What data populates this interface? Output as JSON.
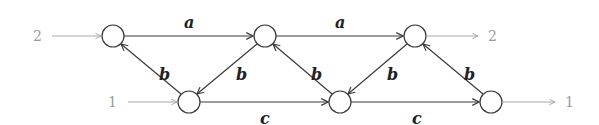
{
  "diagram": {
    "type": "directed-graph",
    "nodes": [
      {
        "id": "t1",
        "row": "top",
        "x": 113,
        "y": 36
      },
      {
        "id": "t2",
        "row": "top",
        "x": 265,
        "y": 36
      },
      {
        "id": "t3",
        "row": "top",
        "x": 415,
        "y": 36
      },
      {
        "id": "b1",
        "row": "bottom",
        "x": 189,
        "y": 102
      },
      {
        "id": "b2",
        "row": "bottom",
        "x": 340,
        "y": 102
      },
      {
        "id": "b3",
        "row": "bottom",
        "x": 491,
        "y": 102
      }
    ],
    "edges": [
      {
        "from": "t1",
        "to": "t2",
        "label": "a"
      },
      {
        "from": "t2",
        "to": "t3",
        "label": "a"
      },
      {
        "from": "b1",
        "to": "t1",
        "label": "b"
      },
      {
        "from": "t2",
        "to": "b1",
        "label": "b"
      },
      {
        "from": "b2",
        "to": "t2",
        "label": "b"
      },
      {
        "from": "t3",
        "to": "b2",
        "label": "b"
      },
      {
        "from": "b3",
        "to": "t3",
        "label": "b"
      },
      {
        "from": "b1",
        "to": "b2",
        "label": "c"
      },
      {
        "from": "b2",
        "to": "b3",
        "label": "c"
      }
    ],
    "ports": {
      "input_top": "2",
      "input_bottom": "1",
      "output_top": "2",
      "output_bottom": "1"
    },
    "labels": {
      "a1": "a",
      "a2": "a",
      "b1": "b",
      "b2": "b",
      "b3": "b",
      "b4": "b",
      "b5": "b",
      "c1": "c",
      "c2": "c"
    },
    "colors": {
      "edge": "#3a3a3a",
      "io": "#a8a8a8",
      "port_text": "#9a9a9a"
    }
  }
}
